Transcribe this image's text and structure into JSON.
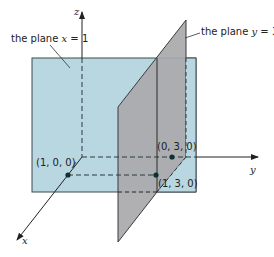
{
  "figure": {
    "plane_x": {
      "label_prefix": "the plane ",
      "var": "x",
      "eq": " = 1"
    },
    "plane_y": {
      "label_prefix": "the plane ",
      "var": "y",
      "eq": " = 3"
    },
    "axes": {
      "x": "x",
      "y": "y",
      "z": "z"
    },
    "points": [
      {
        "label": "(1, 0, 0)"
      },
      {
        "label": "(0, 3, 0)"
      },
      {
        "label": "(1, 3, 0)"
      }
    ],
    "colors": {
      "plane_x_fill": "#b9d7e0",
      "plane_y_fill": "#a9a9ab",
      "line": "#2a3a3e",
      "point": "#0f2f33"
    }
  }
}
